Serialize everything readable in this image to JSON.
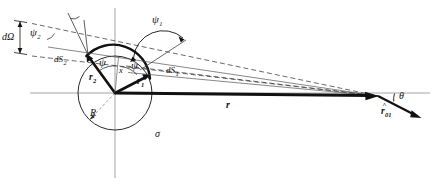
{
  "figure": {
    "type": "geometry-diagram",
    "background_color": "#ffffff",
    "ink_color": "#111111"
  },
  "labels": {
    "d_omega": "dΩ",
    "psi_2": "ψ",
    "psi_2_sub": "2",
    "psi_1": "ψ",
    "psi_1_sub": "1",
    "psi_left": "ψ",
    "psi_right": "ψ",
    "dS_2_d": "d",
    "dS_2_S": "S",
    "dS_2_sub": "2",
    "dS_1_d": "d",
    "dS_1_S": "S",
    "dS_1_sub": "1",
    "vec_r2": "r",
    "vec_r2_sub": "2",
    "vec_r1": "r",
    "vec_r1_sub": "1",
    "x": "x",
    "R": "R",
    "sigma": "σ",
    "vec_r": "r",
    "theta": "θ",
    "r_hat": "r",
    "r_hat_sub": "01",
    "r_hat_accent": "^"
  },
  "geometry": {
    "sphere_center": [
      115,
      93
    ],
    "sphere_radius": 37,
    "observation_point": [
      378,
      96
    ],
    "dS1_point": [
      148,
      76
    ],
    "dS2_point": [
      88,
      55
    ],
    "r_arrow_tip": [
      378,
      96
    ],
    "r_hat_tip": [
      421,
      117
    ]
  }
}
